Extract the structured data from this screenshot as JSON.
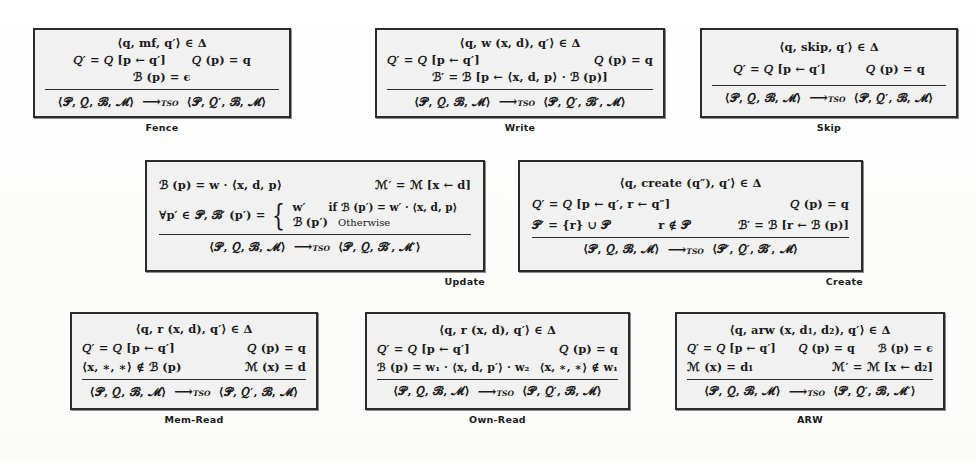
{
  "page": {
    "kind": "inference-rule-figure",
    "background_color": "#ffffff",
    "box_fill_color": "#f1f1f1",
    "box_border_color": "#2b2b2b",
    "transition_label": "TSO"
  },
  "rules": [
    {
      "id": "fence",
      "caption": "Fence",
      "caption_align": "center",
      "premises": [
        {
          "layout": "center",
          "cells": [
            "⟨q, mf, q′⟩ ∈ Δ"
          ]
        },
        {
          "layout": "spaced",
          "cells": [
            "𝑄′ = 𝑄 [p ← q′]",
            "𝑄 (p) = q"
          ]
        },
        {
          "layout": "center",
          "cells": [
            "ℬ (p) = ϵ"
          ]
        }
      ],
      "conclusion_left": "⟨𝒫, 𝑄, ℬ, ℳ⟩",
      "conclusion_right": "⟨𝒫, 𝑄′, ℬ, ℳ⟩"
    },
    {
      "id": "write",
      "caption": "Write",
      "caption_align": "center",
      "premises": [
        {
          "layout": "center",
          "cells": [
            "⟨q, w (x, d), q′⟩ ∈ Δ"
          ]
        },
        {
          "layout": "spread",
          "cells": [
            "𝑄′ = 𝑄 [p ← q′]",
            "𝑄 (p) = q"
          ]
        },
        {
          "layout": "center",
          "cells": [
            "ℬ′ = ℬ [p ← ⟨x, d, p⟩ · ℬ (p)]"
          ]
        }
      ],
      "conclusion_left": "⟨𝒫, 𝑄, ℬ, ℳ⟩",
      "conclusion_right": "⟨𝒫, 𝑄′, ℬ′, ℳ⟩"
    },
    {
      "id": "skip",
      "caption": "Skip",
      "caption_align": "center",
      "premises": [
        {
          "layout": "center",
          "cells": [
            "⟨q, skip, q′⟩ ∈ Δ"
          ]
        },
        {
          "layout": "spaced-wide",
          "cells": [
            "𝑄′ = 𝑄 [p ← q′]",
            "𝑄 (p) = q"
          ]
        }
      ],
      "conclusion_left": "⟨𝒫, 𝑄, ℬ, ℳ⟩",
      "conclusion_right": "⟨𝒫, 𝑄′, ℬ, ℳ⟩"
    },
    {
      "id": "update",
      "caption": "Update",
      "caption_align": "right",
      "premises": [
        {
          "layout": "spread",
          "cells": [
            "ℬ (p) = w · ⟨x, d, p⟩",
            "ℳ′ = ℳ [x ← d]"
          ]
        }
      ],
      "case_prefix": "∀p′ ∈ 𝒫, ℬ′ (p′) =",
      "cases": [
        {
          "value": "w′",
          "condition": "if  ℬ (p′) = w′ · ⟨x, d, p⟩"
        },
        {
          "value": "ℬ (p′)",
          "condition": "Otherwise"
        }
      ],
      "conclusion_left": "⟨𝒫, 𝑄, ℬ, ℳ⟩",
      "conclusion_right": "⟨𝒫, 𝑄, ℬ′, ℳ′⟩"
    },
    {
      "id": "create",
      "caption": "Create",
      "caption_align": "right",
      "premises": [
        {
          "layout": "center",
          "cells": [
            "⟨q, create (q″), q′⟩ ∈ Δ"
          ]
        },
        {
          "layout": "spread",
          "cells": [
            "𝑄′ = 𝑄 [p ← q′, r ← q″]",
            "𝑄 (p) = q"
          ]
        },
        {
          "layout": "spread",
          "cells": [
            "𝒫′ = {r} ∪ 𝒫",
            "r ∉ 𝒫",
            "ℬ′ = ℬ [r ← ℬ (p)]"
          ]
        }
      ],
      "conclusion_left": "⟨𝒫, 𝑄, ℬ, ℳ⟩",
      "conclusion_right": "⟨𝒫′, 𝑄′, ℬ′, ℳ⟩"
    },
    {
      "id": "mem-read",
      "caption": "Mem-Read",
      "caption_align": "center",
      "premises": [
        {
          "layout": "center",
          "cells": [
            "⟨q, r (x, d), q′⟩ ∈ Δ"
          ]
        },
        {
          "layout": "spread",
          "cells": [
            "𝑄′ = 𝑄 [p ← q′]",
            "𝑄 (p) = q"
          ]
        },
        {
          "layout": "spread",
          "cells": [
            "⟨x, ∗, ∗⟩ ∉ ℬ (p)",
            "ℳ (x) = d"
          ]
        }
      ],
      "conclusion_left": "⟨𝒫, 𝑄, ℬ, ℳ⟩",
      "conclusion_right": "⟨𝒫, 𝑄′, ℬ, ℳ⟩"
    },
    {
      "id": "own-read",
      "caption": "Own-Read",
      "caption_align": "center",
      "premises": [
        {
          "layout": "center",
          "cells": [
            "⟨q, r (x, d), q′⟩ ∈ Δ"
          ]
        },
        {
          "layout": "spread",
          "cells": [
            "𝑄′ = 𝑄 [p ← q′]",
            "𝑄 (p) = q"
          ]
        },
        {
          "layout": "spread",
          "cells": [
            "ℬ (p) = w₁ · ⟨x, d, p′⟩ · w₂",
            "⟨x, ∗, ∗⟩ ∉ w₁"
          ]
        }
      ],
      "conclusion_left": "⟨𝒫, 𝑄, ℬ, ℳ⟩",
      "conclusion_right": "⟨𝒫, 𝑄′, ℬ, ℳ⟩"
    },
    {
      "id": "arw",
      "caption": "ARW",
      "caption_align": "center",
      "premises": [
        {
          "layout": "center",
          "cells": [
            "⟨q, arw (x, d₁, d₂), q′⟩ ∈ Δ"
          ]
        },
        {
          "layout": "spread",
          "cells": [
            "𝑄′ = 𝑄 [p ← q′]",
            "𝑄 (p) = q",
            "ℬ (p) = ϵ"
          ]
        },
        {
          "layout": "spread",
          "cells": [
            "ℳ (x) = d₁",
            "ℳ′ = ℳ [x ← d₂]"
          ]
        }
      ],
      "conclusion_left": "⟨𝒫, 𝑄, ℬ, ℳ⟩",
      "conclusion_right": "⟨𝒫, 𝑄′, ℬ, ℳ′⟩"
    }
  ]
}
